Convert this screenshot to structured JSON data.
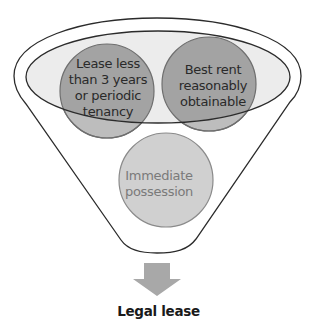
{
  "diagram": {
    "type": "funnel",
    "nodes": [
      {
        "id": "lease-term",
        "lines": [
          "Lease less",
          "than 3 years",
          "or periodic",
          "tenancy"
        ],
        "fill": "#a6a6a6"
      },
      {
        "id": "best-rent",
        "lines": [
          "Best rent",
          "reasonably",
          "obtainable"
        ],
        "fill": "#a6a6a6"
      },
      {
        "id": "possession",
        "lines": [
          "Immediate",
          "possession"
        ],
        "fill": "#d0d0d0"
      }
    ],
    "result": {
      "label": "Legal lease"
    },
    "colors": {
      "funnel_stroke": "#2b2b2b",
      "inner_ellipse_fill": "#e6e6e6",
      "circle_fill_dark": "#a6a6a6",
      "circle_fill_light": "#d0d0d0",
      "circle_stroke": "#6e6e6e",
      "arrow_fill": "#a8a8a8"
    }
  }
}
